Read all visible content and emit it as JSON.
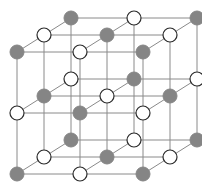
{
  "diagram": {
    "title": "",
    "type": "crystal-lattice",
    "colors": {
      "gray_atom": "#858585",
      "white_atom": "#ffffff",
      "white_outline": "#2a2a2a",
      "bond": "#8a8a8a",
      "background": "#ffffff"
    },
    "atom_radius": 7,
    "grid": {
      "origin": [
        17,
        52
      ],
      "x_step": [
        63,
        0
      ],
      "depth_step": [
        27,
        -17
      ],
      "layer_step": [
        0,
        61
      ],
      "size": [
        3,
        3,
        3
      ]
    },
    "layers": [
      {
        "name": "top",
        "rows": [
          [
            "gray",
            "white",
            "gray"
          ],
          [
            "white",
            "gray",
            "white"
          ],
          [
            "gray",
            "white",
            "gray"
          ]
        ]
      },
      {
        "name": "middle",
        "rows": [
          [
            "white",
            "gray",
            "white"
          ],
          [
            "gray",
            "white",
            "gray"
          ],
          [
            "white",
            "gray",
            "white"
          ]
        ]
      },
      {
        "name": "bottom",
        "rows": [
          [
            "gray",
            "white",
            "gray"
          ],
          [
            "white",
            "gray",
            "white"
          ],
          [
            "gray",
            "white",
            "gray"
          ]
        ]
      }
    ]
  }
}
